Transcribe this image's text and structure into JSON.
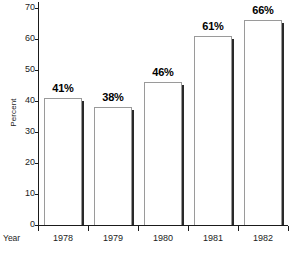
{
  "chart_data": {
    "type": "bar",
    "title": "",
    "xlabel": "Year",
    "ylabel": "Percent",
    "categories": [
      "1978",
      "1979",
      "1980",
      "1981",
      "1982"
    ],
    "values": [
      41,
      38,
      46,
      61,
      66
    ],
    "value_labels": [
      "41%",
      "38%",
      "46%",
      "61%",
      "66%"
    ],
    "ylim": [
      0,
      70
    ],
    "y_ticks": [
      0,
      10,
      20,
      30,
      40,
      50,
      60,
      70
    ],
    "y_tick_labels": [
      "0",
      "10",
      "20",
      "30",
      "40",
      "50",
      "60",
      "70"
    ],
    "grid": false,
    "legend": null,
    "bar_fill_color": "#ffffff",
    "bar_outline_color": "#9a9a9a",
    "bar_shadow_color": "#2a2a2a",
    "axis_color": "#1a1a1a",
    "text_color": "#1c1c1c",
    "background_color": "#ffffff"
  }
}
